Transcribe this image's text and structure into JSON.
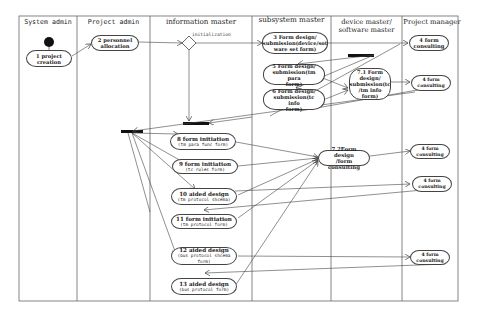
{
  "diagram": {
    "type": "UML activity diagram with swimlanes",
    "lanes": [
      {
        "id": "system-admin",
        "label": "System admin"
      },
      {
        "id": "project-admin",
        "label": "Project admin"
      },
      {
        "id": "information-master",
        "label": "information master"
      },
      {
        "id": "subsystem-master",
        "label": "subsystem master"
      },
      {
        "id": "device-software-master",
        "label": "device master/ software master"
      },
      {
        "id": "project-manager",
        "label": "Project manager"
      }
    ],
    "guard_label": "initialization",
    "nodes": {
      "n1": {
        "line1": "1 project",
        "line2": "creation"
      },
      "n2": {
        "line1": "2 personnel",
        "line2": "allocation"
      },
      "n3": {
        "line1": "3 Form design/",
        "line2": "submission(device/sot",
        "line3": "ware set form)"
      },
      "n4a": {
        "line1": "4 form",
        "line2": "consulting"
      },
      "n5": {
        "line1": "5 Form design/",
        "line2": "submission(tm para",
        "line3": "form)"
      },
      "n6": {
        "line1": "6 Form design/",
        "line2": "submission(tc info",
        "line3": "form)"
      },
      "n71": {
        "line1": "7.1 Form",
        "line2": "design/",
        "line3": "submission(tc",
        "line4": "/tm info form)"
      },
      "n4b": {
        "line1": "4 form",
        "line2": "consulting"
      },
      "n8": {
        "line1": "8 form initiation",
        "line2": "(tm para func",
        "line3": "form)"
      },
      "n9": {
        "line1": "9 form initiation",
        "line2": "(tc rules form)"
      },
      "n72": {
        "line1": "7.2Form design",
        "line2": "/form consulting"
      },
      "n4c": {
        "line1": "4 form",
        "line2": "consulting"
      },
      "n10": {
        "line1": "10 aided design",
        "line2": "(tm protocol",
        "line3": "shcema)"
      },
      "n4d": {
        "line1": "4 form",
        "line2": "consulting"
      },
      "n11": {
        "line1": "11 form initiation",
        "line2": "(tm protocol form)"
      },
      "n12": {
        "line1": "12 aided design",
        "line2": "(bus protocol",
        "line3": "shcema form)"
      },
      "n4e": {
        "line1": "4 form",
        "line2": "consulting"
      },
      "n13": {
        "line1": "13 aided design",
        "line2": "(bus protocol",
        "line3": "form)"
      }
    }
  }
}
